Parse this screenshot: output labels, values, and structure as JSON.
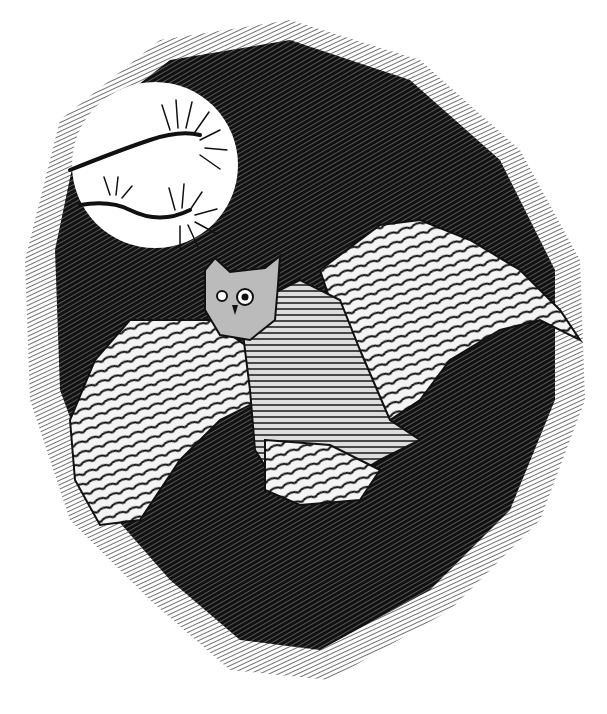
{
  "image": {
    "subject": "great horned owl in flight at night",
    "style": "pen-and-ink crosshatch illustration",
    "colors": {
      "ink": "#0a0a0a",
      "paper": "#ffffff",
      "mid": "#555555"
    },
    "elements": [
      "dark crosshatched night sky",
      "full moon",
      "pine branch silhouette",
      "owl with spread wings"
    ]
  }
}
